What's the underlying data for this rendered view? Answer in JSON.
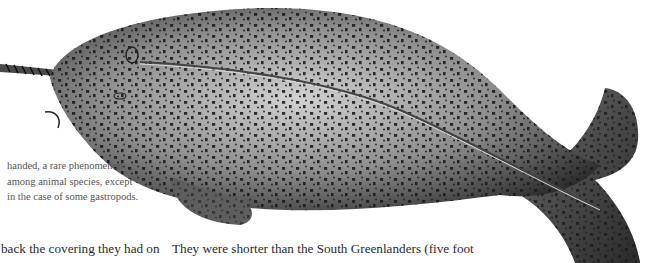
{
  "figure": {
    "icon": "narwhal-illustration",
    "colors": {
      "body_dark": "#2b2b2b",
      "body_mid": "#7a7a7a",
      "body_light": "#c9c9c9",
      "spots": "#1a1a1a"
    }
  },
  "caption": {
    "lines": [
      "handed, a rare phenomenon",
      "among animal species, except",
      "in the case of some gastropods."
    ]
  },
  "body_text": {
    "left_column_line": "back the covering they had on",
    "right_column_line": "They were shorter than the South Greenlanders (five foot"
  }
}
